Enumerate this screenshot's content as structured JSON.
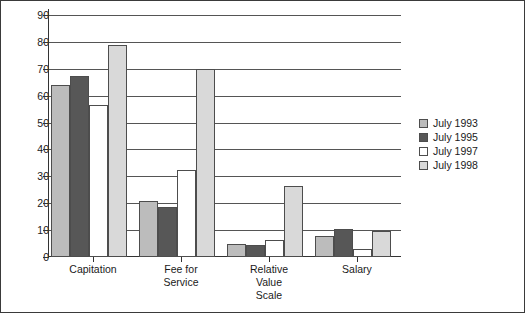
{
  "chart_data": {
    "type": "bar",
    "title": "",
    "subtitle": "",
    "xlabel": "",
    "ylabel": "",
    "ylim": [
      0,
      90
    ],
    "ytick_step": 10,
    "yticks": [
      0,
      10,
      20,
      30,
      40,
      50,
      60,
      70,
      80,
      90
    ],
    "grid": "horizontal",
    "legend_position": "right",
    "categories": [
      "Capitation",
      "Fee for\nService",
      "Relative\nValue\nScale",
      "Salary"
    ],
    "series": [
      {
        "name": "July 1993",
        "color": "#bcbcbc",
        "values": [
          64,
          21,
          5,
          8
        ]
      },
      {
        "name": "July 1995",
        "color": "#575757",
        "values": [
          67.5,
          18.5,
          4.5,
          10.5
        ]
      },
      {
        "name": "July 1997",
        "color": "#ffffff",
        "values": [
          56.5,
          32.5,
          6.5,
          3
        ]
      },
      {
        "name": "July 1998",
        "color": "#d9d9d9",
        "values": [
          79,
          70,
          26.5,
          9.5
        ]
      }
    ]
  },
  "legend": {
    "items": [
      {
        "label": "July 1993",
        "swatch": "#bcbcbc"
      },
      {
        "label": "July 1995",
        "swatch": "#575757"
      },
      {
        "label": "July 1997",
        "swatch": "#ffffff"
      },
      {
        "label": "July 1998",
        "swatch": "#d9d9d9"
      }
    ]
  },
  "colors": {
    "border": "#3a3a3a",
    "axis": "#333333",
    "gridline": "#555555",
    "text": "#1a1a1a",
    "background": "#ffffff"
  }
}
